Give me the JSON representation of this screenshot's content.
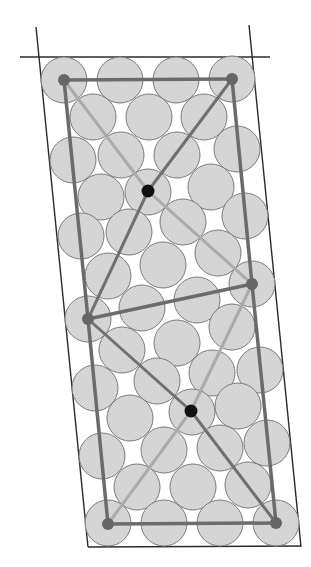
{
  "diagram": {
    "type": "circle-packing-lattice",
    "canvas": {
      "width": 311,
      "height": 567
    },
    "colors": {
      "background": "#ffffff",
      "circle_fill": "#d6d6d6",
      "circle_stroke": "#7a7a7a",
      "frame_line": "#2a2a2a",
      "cell_edge": "#6b6b6b",
      "dark_diagonal": "#707070",
      "light_diagonal": "#ababab",
      "lattice_point": "#666666",
      "center_point": "#111111"
    },
    "circle_radius": 23,
    "frame_lines": [
      {
        "name": "top-horizontal-line",
        "x1": 20,
        "y1": 57,
        "x2": 270,
        "y2": 57
      },
      {
        "name": "left-boundary-line",
        "x1": 36,
        "y1": 27,
        "x2": 88,
        "y2": 547
      },
      {
        "name": "right-boundary-line",
        "x1": 249,
        "y1": 25,
        "x2": 301,
        "y2": 547
      },
      {
        "name": "bottom-boundary-line",
        "x1": 88,
        "y1": 547,
        "x2": 301,
        "y2": 546
      }
    ],
    "circles": [
      [
        64,
        80
      ],
      [
        120,
        80
      ],
      [
        176,
        80
      ],
      [
        232,
        79
      ],
      [
        93,
        117
      ],
      [
        149,
        117
      ],
      [
        204,
        117
      ],
      [
        73,
        160
      ],
      [
        121,
        155
      ],
      [
        177,
        155
      ],
      [
        237,
        149
      ],
      [
        101,
        197
      ],
      [
        148,
        192
      ],
      [
        211,
        187
      ],
      [
        81,
        236
      ],
      [
        129,
        232
      ],
      [
        183,
        222
      ],
      [
        245,
        216
      ],
      [
        108,
        276
      ],
      [
        163,
        265
      ],
      [
        218,
        253
      ],
      [
        88,
        319
      ],
      [
        142,
        308
      ],
      [
        197,
        300
      ],
      [
        252,
        284
      ],
      [
        122,
        350
      ],
      [
        177,
        343
      ],
      [
        232,
        327
      ],
      [
        95,
        388
      ],
      [
        157,
        381
      ],
      [
        212,
        373
      ],
      [
        260,
        370
      ],
      [
        130,
        418
      ],
      [
        192,
        412
      ],
      [
        238,
        406
      ],
      [
        102,
        456
      ],
      [
        164,
        450
      ],
      [
        220,
        448
      ],
      [
        267,
        443
      ],
      [
        137,
        487
      ],
      [
        193,
        487
      ],
      [
        248,
        485
      ],
      [
        108,
        523
      ],
      [
        164,
        523
      ],
      [
        220,
        523
      ],
      [
        276,
        523
      ]
    ],
    "cell_edges": [
      {
        "name": "cell-top-edge",
        "points": [
          [
            64,
            80
          ],
          [
            232,
            79
          ]
        ]
      },
      {
        "name": "cell-left-edge",
        "points": [
          [
            64,
            80
          ],
          [
            88,
            319
          ],
          [
            108,
            524
          ]
        ]
      },
      {
        "name": "cell-right-edge",
        "points": [
          [
            232,
            79
          ],
          [
            252,
            284
          ],
          [
            276,
            523
          ]
        ]
      },
      {
        "name": "cell-bottom-edge",
        "points": [
          [
            108,
            524
          ],
          [
            276,
            523
          ]
        ]
      },
      {
        "name": "cell-middle-edge",
        "points": [
          [
            88,
            319
          ],
          [
            252,
            284
          ]
        ]
      }
    ],
    "dark_diagonals": [
      {
        "name": "upper-dark-diagonal",
        "points": [
          [
            232,
            79
          ],
          [
            148,
            191
          ],
          [
            88,
            319
          ]
        ]
      },
      {
        "name": "lower-dark-diagonal",
        "points": [
          [
            88,
            319
          ],
          [
            191,
            411
          ],
          [
            276,
            523
          ]
        ]
      }
    ],
    "light_diagonals": [
      {
        "name": "upper-light-diagonal",
        "points": [
          [
            64,
            80
          ],
          [
            148,
            191
          ],
          [
            252,
            284
          ]
        ]
      },
      {
        "name": "lower-light-diagonal",
        "points": [
          [
            252,
            284
          ],
          [
            191,
            411
          ],
          [
            108,
            524
          ]
        ]
      }
    ],
    "lattice_points": [
      [
        64,
        80
      ],
      [
        232,
        79
      ],
      [
        88,
        319
      ],
      [
        252,
        284
      ],
      [
        108,
        524
      ],
      [
        276,
        523
      ]
    ],
    "center_points": [
      [
        148,
        191
      ],
      [
        191,
        411
      ]
    ]
  }
}
